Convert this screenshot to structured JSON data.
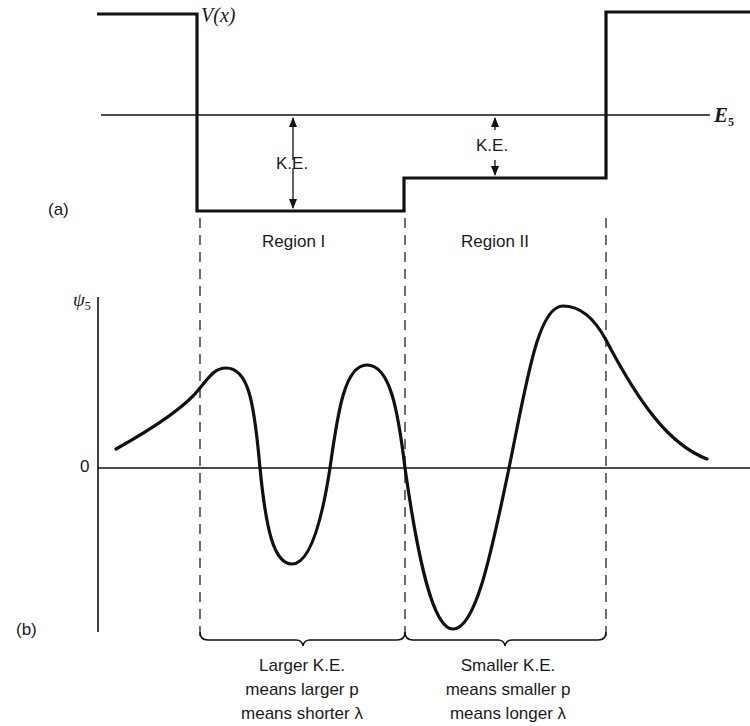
{
  "panel_a": {
    "label": "(a)",
    "potential_label_main": "V",
    "potential_label_arg": "(x)",
    "energy_label_main": "E",
    "energy_label_sub": "5",
    "ke_label_region1": "K.E.",
    "ke_label_region2": "K.E.",
    "region1_label": "Region I",
    "region2_label": "Region II"
  },
  "panel_b": {
    "label": "(b)",
    "psi_label_main": "ψ",
    "psi_label_sub": "5",
    "zero_label": "0",
    "caption_region1": {
      "line1": "Larger K.E.",
      "line2": "means larger p",
      "line3": "means shorter λ"
    },
    "caption_region2": {
      "line1": "Smaller K.E.",
      "line2": "means smaller p",
      "line3": "means longer λ"
    }
  },
  "colors": {
    "ink": "#111111",
    "background": "#ffffff"
  }
}
